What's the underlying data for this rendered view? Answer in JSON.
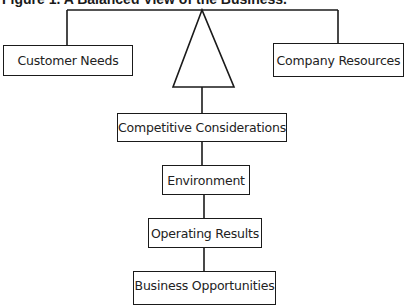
{
  "figure": {
    "title": "Figure 1.  A Balanced View of the Business."
  },
  "nodes": {
    "customer_needs": "Customer Needs",
    "company_resources": "Company Resources",
    "balance_symbol": "triangle-fulcrum",
    "competitive_considerations": "Competitive Considerations",
    "environment": "Environment",
    "operating_results": "Operating Results",
    "business_opportunities": "Business Opportunities"
  },
  "colors": {
    "line": "#1a1a1a",
    "background": "#ffffff"
  }
}
